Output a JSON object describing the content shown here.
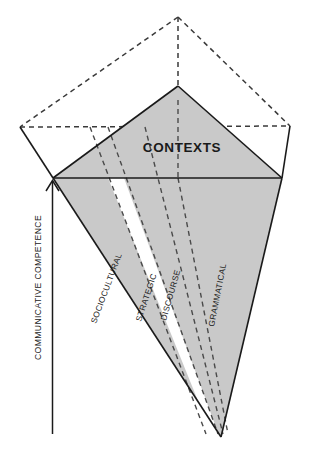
{
  "figure": {
    "title_label": "CONTEXTS",
    "axis_label": "COMMUNICATIVE COMPETENCE",
    "wedges": [
      {
        "id": "sociocultural",
        "label": "SOCIOCULTURAL"
      },
      {
        "id": "strategic",
        "label": "STRATEGIC"
      },
      {
        "id": "discourse",
        "label": "DISCOURSE"
      },
      {
        "id": "grammatical",
        "label": "GRAMMATICAL"
      }
    ],
    "colors": {
      "fill": "#c9c9c9",
      "stroke": "#1a1a1a",
      "dashed_stroke": "#4a4a4a",
      "background": "#ffffff",
      "gap": "#ffffff"
    }
  }
}
